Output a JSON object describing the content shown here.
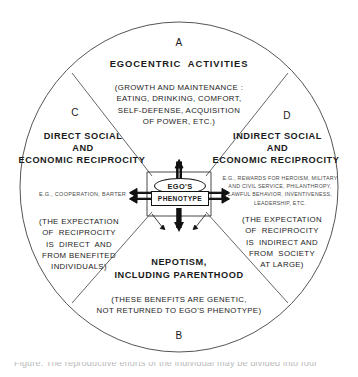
{
  "figure": {
    "type": "sector-circle-diagram",
    "shape": "circle divided into four sectors by two diagonal chords crossing at center",
    "center_node": {
      "oval_label": "EGO'S",
      "box_label": "PHENOTYPE"
    },
    "sector_letters": {
      "top": "A",
      "bottom": "B",
      "left": "C",
      "right": "D"
    },
    "sectors": [
      {
        "letter": "A",
        "position": "top",
        "heading": "EGOCENTRIC  ACTIVITIES",
        "detail": "(GROWTH AND MAINTENANCE :\nEATING, DRINKING, COMFORT,\nSELF-DEFENSE, ACQUISITION\nOF POWER, ETC.)"
      },
      {
        "letter": "C",
        "position": "left",
        "heading_line1": "DIRECT SOCIAL",
        "heading_line2": "AND",
        "heading_line3": "ECONOMIC RECIPROCITY",
        "example": "E.G., COOPERATION, BARTER",
        "detail": "(THE EXPECTATION\nOF  RECIPROCITY\nIS  DIRECT  AND\nFROM BENEFITED\nINDIVIDUALS)"
      },
      {
        "letter": "D",
        "position": "right",
        "heading_line1": "INDIRECT SOCIAL",
        "heading_line2": "AND",
        "heading_line3": "ECONOMIC RECIPROCITY",
        "example": "E.G., REWARDS FOR HEROISM, MILITARY\nAND CIVIL SERVICE, PHILANTHROPY,\nLAWFUL BEHAVIOR, INVENTIVENESS,\nLEADERSHIP, ETC.",
        "detail": "(THE EXPECTATION\nOF  RECIPROCITY\nIS  INDIRECT AND\nFROM  SOCIETY\nAT LARGE)"
      },
      {
        "letter": "B",
        "position": "bottom",
        "heading_line1": "NEPOTISM,",
        "heading_line2": "INCLUDING PARENTHOOD",
        "detail": "(THESE BENEFITS ARE GENETIC,\nNOT RETURNED TO EGO'S PHENOTYPE)"
      }
    ],
    "caption_partial": "Figure. The reproductive efforts of the individual may be divided into four"
  }
}
